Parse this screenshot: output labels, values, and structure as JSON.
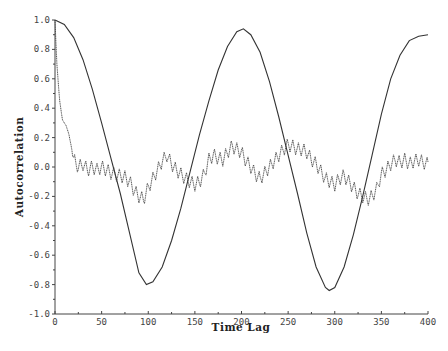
{
  "chart_data": {
    "type": "line",
    "title": "",
    "xlabel": "Time Lag",
    "ylabel": "Autocorrelation",
    "xlim": [
      0,
      400
    ],
    "ylim": [
      -1.0,
      1.0
    ],
    "x_ticks": [
      0,
      50,
      100,
      150,
      200,
      250,
      300,
      350,
      400
    ],
    "y_ticks": [
      -1.0,
      -0.8,
      -0.6,
      -0.4,
      -0.2,
      0.0,
      0.2,
      0.4,
      0.6,
      0.8,
      1.0
    ],
    "y_tick_labels": [
      "-1.0",
      "-0.8",
      "-0.6",
      "-0.4",
      "-0.2",
      "0.0",
      "0.2",
      "0.4",
      "0.6",
      "0.8",
      "1.0"
    ],
    "grid": false,
    "legend": null,
    "series": [
      {
        "name": "smooth periodic autocorrelation",
        "style": "solid",
        "color": "#333333",
        "key_points": {
          "x": [
            0,
            98,
            202,
            294,
            400
          ],
          "y": [
            1.0,
            -0.8,
            0.94,
            -0.84,
            0.9
          ]
        },
        "x": [
          0,
          10,
          20,
          30,
          40,
          50,
          60,
          70,
          80,
          90,
          98,
          105,
          115,
          125,
          135,
          145,
          155,
          165,
          175,
          185,
          195,
          202,
          210,
          220,
          230,
          240,
          250,
          260,
          270,
          280,
          290,
          294,
          300,
          310,
          320,
          330,
          340,
          350,
          360,
          370,
          380,
          390,
          400
        ],
        "y": [
          1.0,
          0.97,
          0.88,
          0.73,
          0.53,
          0.3,
          0.06,
          -0.18,
          -0.45,
          -0.72,
          -0.8,
          -0.78,
          -0.68,
          -0.5,
          -0.28,
          -0.03,
          0.22,
          0.45,
          0.66,
          0.82,
          0.92,
          0.94,
          0.9,
          0.78,
          0.58,
          0.34,
          0.08,
          -0.18,
          -0.45,
          -0.68,
          -0.82,
          -0.84,
          -0.82,
          -0.68,
          -0.46,
          -0.2,
          0.08,
          0.36,
          0.6,
          0.76,
          0.86,
          0.89,
          0.9
        ]
      },
      {
        "name": "noisy autocorrelation",
        "style": "dotted-oscillating",
        "color": "#333333",
        "x": [
          0,
          2,
          5,
          8,
          12,
          15,
          18,
          20,
          25,
          30,
          35,
          40,
          45,
          50,
          55,
          60,
          65,
          70,
          75,
          80,
          85,
          90,
          95,
          100,
          105,
          110,
          115,
          120,
          125,
          130,
          135,
          140,
          145,
          150,
          155,
          160,
          165,
          170,
          175,
          180,
          185,
          190,
          195,
          200,
          205,
          210,
          215,
          220,
          225,
          230,
          235,
          240,
          245,
          250,
          255,
          260,
          265,
          270,
          275,
          280,
          285,
          290,
          295,
          300,
          305,
          310,
          315,
          320,
          325,
          330,
          335,
          340,
          345,
          350,
          355,
          360,
          365,
          370,
          375,
          380,
          385,
          390,
          395,
          400
        ],
        "y": [
          1.0,
          0.7,
          0.45,
          0.32,
          0.28,
          0.22,
          0.12,
          0.05,
          0.0,
          0.02,
          -0.02,
          0.0,
          -0.02,
          0.0,
          -0.02,
          -0.04,
          -0.05,
          -0.06,
          -0.07,
          -0.1,
          -0.16,
          -0.2,
          -0.22,
          -0.14,
          -0.08,
          -0.02,
          0.04,
          0.08,
          0.02,
          -0.02,
          -0.05,
          -0.08,
          -0.1,
          -0.12,
          -0.1,
          -0.05,
          0.05,
          0.08,
          0.06,
          0.05,
          0.1,
          0.14,
          0.12,
          0.1,
          0.04,
          0.0,
          -0.05,
          -0.08,
          -0.04,
          0.0,
          0.04,
          0.08,
          0.12,
          0.15,
          0.14,
          0.12,
          0.12,
          0.1,
          0.05,
          0.02,
          -0.03,
          -0.08,
          -0.1,
          -0.12,
          -0.08,
          -0.06,
          -0.1,
          -0.14,
          -0.18,
          -0.2,
          -0.22,
          -0.2,
          -0.15,
          -0.05,
          -0.02,
          0.02,
          0.05,
          0.03,
          0.05,
          0.02,
          0.04,
          0.05,
          0.03,
          0.02
        ]
      }
    ]
  }
}
